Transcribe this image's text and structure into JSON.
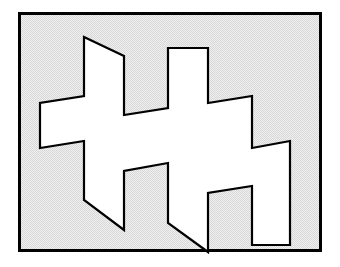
{
  "figure": {
    "title": "Impossible Figure",
    "kind": "line-drawing",
    "colors": {
      "page_background": "#ffffff",
      "panel_background": "#e9e9e9",
      "panel_background_dither_dot": "#d2d2d2",
      "figure_fill": "#ffffff",
      "outline": "#000000",
      "frame": "#000000"
    },
    "frame": {
      "x": 18,
      "y": 12,
      "width": 304,
      "height": 240,
      "stroke_width": 3
    },
    "shape": {
      "stroke_width": 2.2,
      "fill": "#ffffff",
      "stroke": "#000000",
      "points": "84,37 84,96 40,103 40,148 84,141 84,200 124,230 124,171 168,163 168,223 208,252 208,193 252,186 252,245 290,245 290,186 290,141 252,148 252,96 208,103 208,48 168,48 168,108 124,115 124,56 84,37",
      "path_d": "M 84 37 L 84 96 L 40 103 L 40 148 L 84 141 L 84 200 L 124 230 L 124 171 L 168 163 L 168 223 L 208 252 L 208 193 L 252 186 L 252 245 L 290 245 L 290 141 L 252 148 L 252 96 L 208 103 L 208 48 L 168 48 L 168 108 L 124 115 L 124 56 Z"
    }
  },
  "chart_data": {
    "type": "line",
    "title": "Impossible Figure",
    "xlabel": "",
    "ylabel": "",
    "grid": false,
    "legend": "none",
    "xlim": [
      0,
      340
    ],
    "ylim": [
      0,
      267
    ],
    "series": [
      {
        "name": "upper-band-outline",
        "x": [
          40,
          84,
          84,
          124,
          124,
          168,
          168,
          208,
          208,
          252,
          252,
          290,
          290
        ],
        "y": [
          103,
          96,
          37,
          56,
          115,
          108,
          48,
          48,
          103,
          96,
          148,
          141,
          186
        ]
      },
      {
        "name": "lower-band-outline",
        "x": [
          40,
          84,
          84,
          124,
          124,
          168,
          168,
          208,
          208,
          252,
          252,
          290
        ],
        "y": [
          148,
          141,
          200,
          230,
          171,
          163,
          223,
          252,
          193,
          186,
          245,
          245
        ]
      }
    ]
  }
}
